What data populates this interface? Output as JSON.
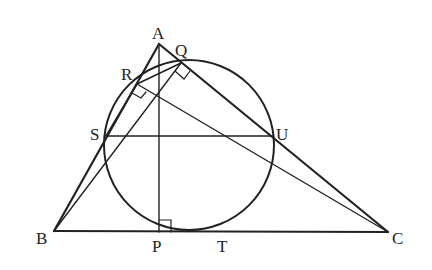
{
  "diagram": {
    "type": "geometry",
    "stroke_color": "#222222",
    "background": "#ffffff",
    "points": {
      "A": {
        "label": "A",
        "x": 159,
        "y": 44
      },
      "B": {
        "label": "B",
        "x": 54,
        "y": 231
      },
      "C": {
        "label": "C",
        "x": 388,
        "y": 232
      },
      "P": {
        "label": "P",
        "x": 159,
        "y": 232
      },
      "Q": {
        "label": "Q",
        "x": 181,
        "y": 63
      },
      "R": {
        "label": "R",
        "x": 137,
        "y": 84
      },
      "S": {
        "label": "S",
        "x": 106,
        "y": 136
      },
      "T": {
        "label": "T",
        "x": 222,
        "y": 232
      },
      "U": {
        "label": "U",
        "x": 273,
        "y": 136
      }
    },
    "circle": {
      "cx": 189,
      "cy": 145,
      "r": 85
    },
    "segments": [
      [
        "A",
        "B"
      ],
      [
        "A",
        "C"
      ],
      [
        "B",
        "C"
      ],
      [
        "A",
        "P"
      ],
      [
        "B",
        "Q"
      ],
      [
        "C",
        "R"
      ],
      [
        "S",
        "U"
      ],
      [
        "R",
        "Q"
      ],
      [
        "R",
        "S"
      ]
    ],
    "right_angles": [
      "P",
      "Q",
      "R"
    ]
  }
}
